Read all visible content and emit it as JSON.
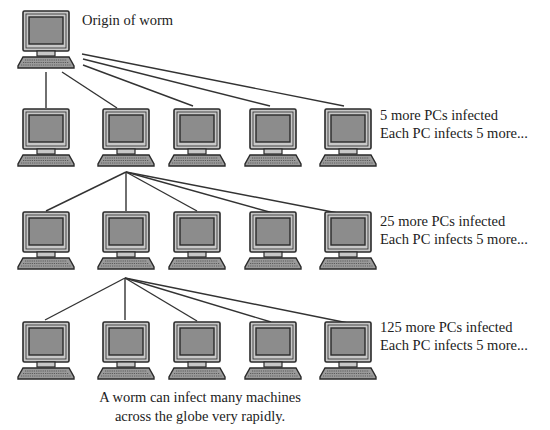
{
  "diagram": {
    "origin": {
      "label": "Origin of worm",
      "x": 17,
      "y": 10
    },
    "columns_x": [
      17,
      97,
      168,
      244,
      319
    ],
    "rows": [
      {
        "y": 108,
        "line1": "5 more PCs infected",
        "line2": "Each PC infects 5 more...",
        "label_y": 106
      },
      {
        "y": 211,
        "line1": "25 more PCs infected",
        "line2": "Each PC infects 5 more...",
        "label_y": 212
      },
      {
        "y": 321,
        "line1": "125 more PCs infected",
        "line2": "Each PC infects 5 more...",
        "label_y": 318
      }
    ],
    "caption": {
      "line1": "A worm can infect many machines",
      "line2": "across the globe very rapidly."
    },
    "connections": [
      {
        "from": [
          46,
          72
        ],
        "to": [
          46,
          108
        ]
      },
      {
        "from": [
          62,
          72
        ],
        "to": [
          117,
          108
        ]
      },
      {
        "from": [
          83,
          65
        ],
        "to": [
          193,
          106
        ]
      },
      {
        "from": [
          83,
          59
        ],
        "to": [
          270,
          106
        ]
      },
      {
        "from": [
          82,
          54
        ],
        "to": [
          344,
          106
        ]
      },
      {
        "from": [
          126,
          172
        ],
        "to": [
          46,
          211
        ]
      },
      {
        "from": [
          126,
          172
        ],
        "to": [
          126,
          211
        ]
      },
      {
        "from": [
          126,
          172
        ],
        "to": [
          197,
          211
        ]
      },
      {
        "from": [
          126,
          172
        ],
        "to": [
          273,
          213
        ]
      },
      {
        "from": [
          126,
          172
        ],
        "to": [
          348,
          215
        ]
      },
      {
        "from": [
          125,
          278
        ],
        "to": [
          45,
          320
        ]
      },
      {
        "from": [
          125,
          278
        ],
        "to": [
          125,
          320
        ]
      },
      {
        "from": [
          125,
          278
        ],
        "to": [
          197,
          321
        ]
      },
      {
        "from": [
          125,
          278
        ],
        "to": [
          271,
          322
        ]
      },
      {
        "from": [
          125,
          278
        ],
        "to": [
          348,
          323
        ]
      }
    ],
    "colors": {
      "line": "#333333",
      "monitor_frame": "#c8c8c8",
      "screen": "#8c8c8c",
      "outline": "#2a2a2a",
      "keyboard": "#9a9a9a"
    }
  }
}
